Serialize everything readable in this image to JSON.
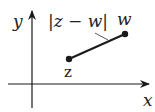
{
  "diagram": {
    "title": "",
    "axes": {
      "x_label": "x",
      "y_label": "y"
    },
    "points": [
      {
        "name": "z",
        "label": "z"
      },
      {
        "name": "w",
        "label": "w"
      }
    ],
    "segment_label": "|z − w|",
    "colors": {
      "stroke": "#1a1a1a",
      "background": "#ffffff"
    }
  }
}
